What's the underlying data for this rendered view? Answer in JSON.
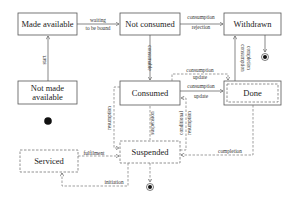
{
  "diagram": {
    "type": "state-machine",
    "states": {
      "made_available": "Made available",
      "not_consumed": "Not consumed",
      "withdrawn": "Withdrawn",
      "not_made_available_1": "Not made",
      "not_made_available_2": "available",
      "consumed": "Consumed",
      "done": "Done",
      "serviced": "Serviced",
      "suspended": "Suspended"
    },
    "transitions": {
      "start": "start",
      "waiting_1": "waiting",
      "waiting_2": "to be bound",
      "rejection_1": "consumption",
      "rejection_2": "rejection",
      "consumable": "consumable",
      "completion_1": "consumption",
      "completion_2": "completion",
      "update_dashed_1": "consumption",
      "update_dashed_2": "update",
      "update_solid_1": "consumption",
      "update_solid_2": "update",
      "resumption": "resumption",
      "suspension": "suspension",
      "conditional_1": "conditional",
      "conditional_2": "resumption",
      "fulfilment": "fulfilment",
      "initiation": "initiation",
      "completion": "completion"
    }
  }
}
